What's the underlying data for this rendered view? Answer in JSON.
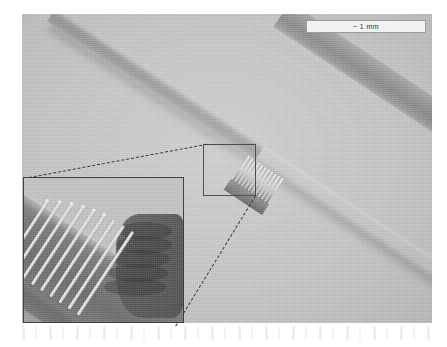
{
  "figure": {
    "type": "sem-micrograph",
    "background_color": "#c9c9c9",
    "fibre_color": "#9a9a9a"
  },
  "scalebar": {
    "label": "~ 1 mm",
    "background_color": "#f2f2f2",
    "border_color": "#9d9d9d"
  },
  "selection_box": {
    "name": "region-of-interest",
    "border_color": "#4d4d4d"
  },
  "inset": {
    "name": "magnified-detail",
    "border_color": "#3f3f3f",
    "wire_color": "#f3f3f3",
    "substrate_color": "#6f6f6f",
    "wire_count": 9
  },
  "leaders": {
    "style": "dashed",
    "color": "#3b3b3b",
    "count": 2
  },
  "device": {
    "name": "interdigitated-comb-structure",
    "tooth_count": 11
  }
}
